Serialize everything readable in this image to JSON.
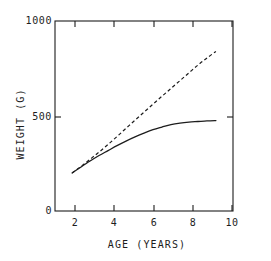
{
  "chart_data": {
    "type": "line",
    "title": "",
    "subtitle": "",
    "xlabel": "AGE  (YEARS)",
    "ylabel": "WEIGHT  (G)",
    "xlim": [
      1.05,
      10.95
    ],
    "ylim": [
      0,
      1000
    ],
    "grid": false,
    "legend": null,
    "frame": "box",
    "tick_direction": "in",
    "xticks": [
      2,
      4,
      6,
      8,
      10
    ],
    "xtick_labels": [
      "2",
      "4",
      "6",
      "8",
      "10"
    ],
    "yticks": [
      0,
      500,
      1000
    ],
    "ytick_labels": [
      "0",
      "500",
      "1000"
    ],
    "line_color": "#1d1d1d",
    "series": [
      {
        "name": "solid-curve",
        "style": "solid",
        "x": [
          2.0,
          2.5,
          3.0,
          3.5,
          4.0,
          4.5,
          5.0,
          5.5,
          6.0,
          6.5,
          7.0,
          7.5,
          8.0,
          8.5,
          9.0,
          9.5,
          10.0
        ],
        "values": [
          200,
          232,
          263,
          292,
          318,
          344,
          368,
          390,
          410,
          428,
          442,
          455,
          463,
          468,
          471,
          474,
          476
        ]
      },
      {
        "name": "dashed-curve",
        "style": "dashed",
        "x": [
          2.0,
          2.5,
          3.0,
          3.5,
          4.0,
          4.5,
          5.0,
          5.5,
          6.0,
          6.5,
          7.0,
          7.5,
          8.0,
          8.5,
          9.0,
          9.5,
          10.0
        ],
        "values": [
          200,
          235,
          272,
          310,
          350,
          392,
          435,
          478,
          520,
          562,
          604,
          645,
          686,
          727,
          768,
          805,
          840
        ]
      }
    ]
  }
}
